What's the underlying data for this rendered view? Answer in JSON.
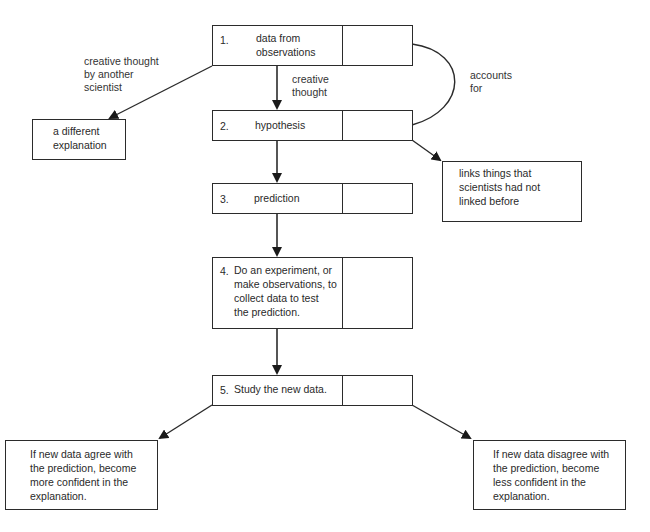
{
  "diagram": {
    "type": "flowchart",
    "steps": [
      {
        "number": "1.",
        "text": "data from observations",
        "lines": [
          "data from",
          "observations"
        ]
      },
      {
        "number": "2.",
        "text": "hypothesis"
      },
      {
        "number": "3.",
        "text": "prediction"
      },
      {
        "number": "4.",
        "text": "Do an experiment, or make observations, to collect data to test the prediction.",
        "lines": [
          "Do an experiment, or",
          "make observations, to",
          "collect data to test",
          "the prediction."
        ]
      },
      {
        "number": "5.",
        "text": "Study the new data."
      }
    ],
    "side_boxes": {
      "different_explanation": {
        "lines": [
          "a different",
          "explanation"
        ]
      },
      "links_things": {
        "lines": [
          "links things that",
          "scientists had not",
          "linked before"
        ]
      },
      "agree": {
        "lines": [
          "If new data agree with",
          "the prediction, become",
          "more confident in the",
          "explanation."
        ]
      },
      "disagree": {
        "lines": [
          "If new data disagree with",
          "the prediction, become",
          "less confident in the",
          "explanation."
        ]
      }
    },
    "edge_labels": {
      "creative_thought": [
        "creative",
        "thought"
      ],
      "another_scientist": [
        "creative thought",
        "by another",
        "scientist"
      ],
      "accounts_for": [
        "accounts",
        "for"
      ]
    },
    "colors": {
      "line": "#2b2b2b",
      "text": "#2a2a2a",
      "background": "#ffffff"
    }
  }
}
